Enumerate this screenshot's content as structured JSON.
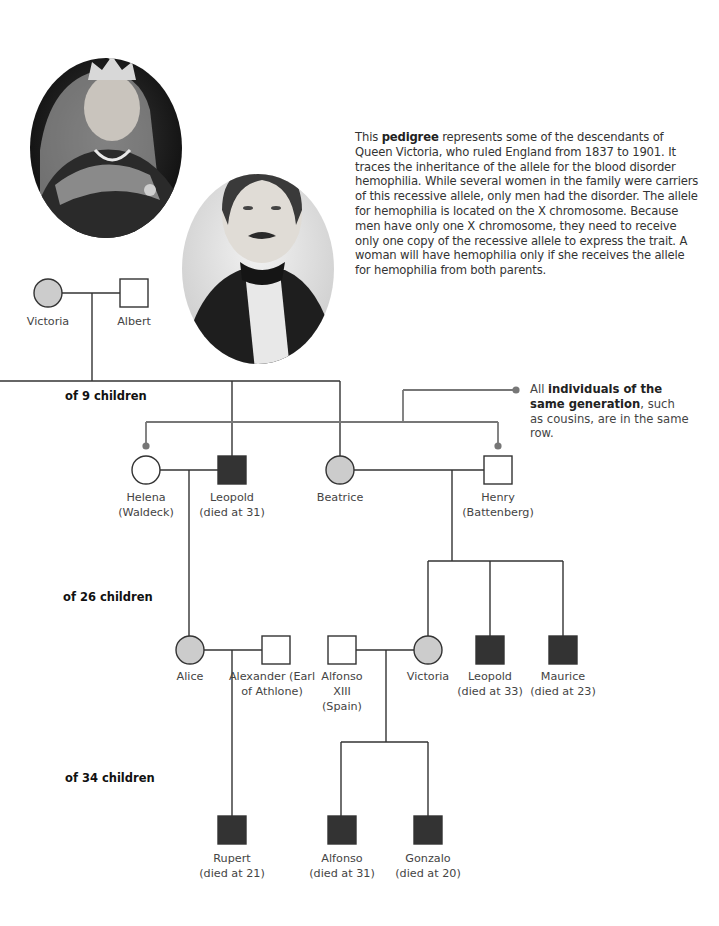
{
  "description": {
    "prefix": "This ",
    "bold": "pedigree",
    "text": " represents some of the descendants of Queen Victoria, who ruled England from 1837 to 1901. It traces the inheritance of the allele for the blood disorder hemophilia. While several women in the family were carriers of this recessive allele, only men had the disorder. The allele for hemophilia is located on the X chromosome. Because men have only one X chromosome, they need to receive only one copy of the recessive allele to express the trait. A woman will have hemophilia only if she receives the allele for hemophilia from both parents."
  },
  "callout": {
    "prefix": "All ",
    "bold": "individuals of the same generation",
    "text": ", such as cousins, are in the same row."
  },
  "generations": [
    {
      "label": "of 9 children"
    },
    {
      "label": "of 26 children"
    },
    {
      "label": "of 34 children"
    }
  ],
  "portraits": [
    {
      "name": "Queen Victoria portrait"
    },
    {
      "name": "Prince Albert portrait"
    }
  ],
  "legend_colors": {
    "carrier_female": "#cccccc",
    "affected_male": "#333333",
    "unaffected": "#ffffff",
    "line": "#333333",
    "callout_line": "#777777"
  },
  "people": {
    "victoria1": {
      "name": "Victoria",
      "detail": "",
      "status": "carrier"
    },
    "albert": {
      "name": "Albert",
      "detail": "",
      "status": "unaffected"
    },
    "helena": {
      "name": "Helena",
      "detail": "(Waldeck)",
      "status": "unaffected"
    },
    "leopold1": {
      "name": "Leopold",
      "detail": "(died at 31)",
      "status": "affected"
    },
    "beatrice": {
      "name": "Beatrice",
      "detail": "",
      "status": "carrier"
    },
    "henry": {
      "name": "Henry",
      "detail": "(Battenberg)",
      "status": "unaffected"
    },
    "alice": {
      "name": "Alice",
      "detail": "",
      "status": "carrier"
    },
    "alexander": {
      "name": "Alexander (Earl",
      "detail": "of Athlone)",
      "status": "unaffected"
    },
    "alfonso13": {
      "name": "Alfonso",
      "detail": "XIII",
      "detail2": "(Spain)",
      "status": "unaffected"
    },
    "victoria2": {
      "name": "Victoria",
      "detail": "",
      "status": "carrier"
    },
    "leopold2": {
      "name": "Leopold",
      "detail": "(died at 33)",
      "status": "affected"
    },
    "maurice": {
      "name": "Maurice",
      "detail": "(died at 23)",
      "status": "affected"
    },
    "rupert": {
      "name": "Rupert",
      "detail": "(died at 21)",
      "status": "affected"
    },
    "alfonso": {
      "name": "Alfonso",
      "detail": "(died at 31)",
      "status": "affected"
    },
    "gonzalo": {
      "name": "Gonzalo",
      "detail": "(died at 20)",
      "status": "affected"
    }
  }
}
